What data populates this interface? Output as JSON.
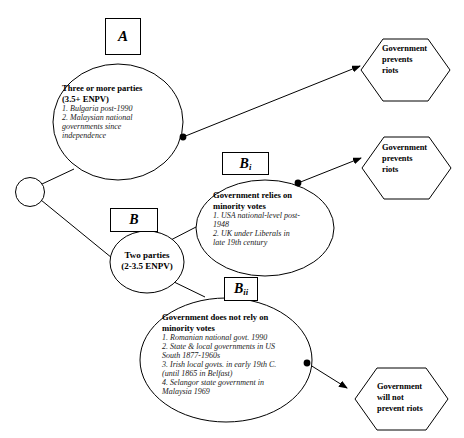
{
  "diagram": {
    "style": {
      "stroke": "#000000",
      "fill": "#ffffff",
      "text": "#000000"
    },
    "root_node": {
      "name": "root-decision-node",
      "shape": "circle"
    },
    "labels": {
      "a": "A",
      "b": "B",
      "bi_main": "B",
      "bi_sub": "i",
      "bii_main": "B",
      "bii_sub": "ii"
    },
    "nodes": [
      {
        "id": "three-or-more-parties",
        "shape": "ellipse",
        "heading_line1": "Three or more parties",
        "heading_line2": "(3.5+ ENPV)",
        "items": [
          "1. Bulgaria post-1990",
          "2. Malaysian national",
          "governments since",
          "independence"
        ]
      },
      {
        "id": "two-parties",
        "shape": "ellipse",
        "heading_line1": "Two parties",
        "heading_line2": "(2-3.5 ENPV)",
        "items": []
      },
      {
        "id": "government-relies-on-minority-votes",
        "shape": "ellipse",
        "heading_line1": "Government relies on",
        "heading_line2": "minority votes",
        "items": [
          "1. USA national-level post-",
          "1948",
          "2. UK under Liberals in",
          "late 19th century"
        ]
      },
      {
        "id": "government-does-not-rely-on-minority-votes",
        "shape": "ellipse",
        "heading_line1": "Government does not rely on",
        "heading_line2": "minority votes",
        "items": [
          "1. Romanian national govt. 1990",
          "2. State & local governments in US",
          "South 1877-1960s",
          "3. Irish local govts. in early 19th C.",
          "(until 1865 in Belfast)",
          "4. Selangor state government in",
          "Malaysia 1969"
        ]
      }
    ],
    "outcomes": [
      {
        "id": "outcome-prevents-riots-top",
        "shape": "hexagon",
        "lines": [
          "Government",
          "prevents",
          "riots"
        ]
      },
      {
        "id": "outcome-prevents-riots-middle",
        "shape": "hexagon",
        "lines": [
          "Government",
          "prevents",
          "riots"
        ]
      },
      {
        "id": "outcome-will-not-prevent-riots",
        "shape": "hexagon",
        "lines": [
          "Government",
          "will not",
          "prevent riots"
        ]
      }
    ],
    "edges": [
      {
        "id": "edge-root-to-three-parties",
        "from": "root-decision-node",
        "to": "three-or-more-parties",
        "arrow": false
      },
      {
        "id": "edge-root-to-two-parties",
        "from": "root-decision-node",
        "to": "two-parties",
        "arrow": false
      },
      {
        "id": "edge-three-parties-to-prevents-riots",
        "from": "three-or-more-parties",
        "to": "outcome-prevents-riots-top",
        "arrow": true
      },
      {
        "id": "edge-two-parties-to-relies",
        "from": "two-parties",
        "to": "government-relies-on-minority-votes",
        "arrow": false
      },
      {
        "id": "edge-two-parties-to-not-rely",
        "from": "two-parties",
        "to": "government-does-not-rely-on-minority-votes",
        "arrow": false
      },
      {
        "id": "edge-relies-to-prevents-riots",
        "from": "government-relies-on-minority-votes",
        "to": "outcome-prevents-riots-middle",
        "arrow": true
      },
      {
        "id": "edge-not-rely-to-will-not-prevent",
        "from": "government-does-not-rely-on-minority-votes",
        "to": "outcome-will-not-prevent-riots",
        "arrow": true
      }
    ]
  }
}
